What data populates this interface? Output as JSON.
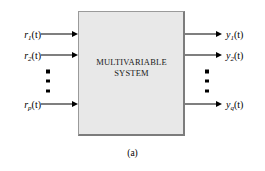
{
  "figure": {
    "caption": "(a)",
    "block": {
      "line1": "MULTIVARIABLE",
      "line2": "SYSTEM",
      "fill_color": "#e8e8e8",
      "border_color": "#7c7c7c"
    },
    "inputs": [
      {
        "base": "r",
        "sub": "1",
        "arg": "(t)",
        "full": "r1(t)",
        "y": 34
      },
      {
        "base": "r",
        "sub": "2",
        "arg": "(t)",
        "full": "r2(t)",
        "y": 55
      },
      {
        "base": "r",
        "sub": "p",
        "arg": "(t)",
        "full": "rp(t)",
        "y": 104
      }
    ],
    "outputs": [
      {
        "base": "y",
        "sub": "1",
        "arg": "(t)",
        "full": "y1(t)",
        "y": 34
      },
      {
        "base": "y",
        "sub": "2",
        "arg": "(t)",
        "full": "y2(t)",
        "y": 55
      },
      {
        "base": "y",
        "sub": "q",
        "arg": "(t)",
        "full": "yq(t)",
        "y": 104
      }
    ],
    "ellipsis": {
      "input_dots": 3,
      "output_dots": 3,
      "meaning": "vertical-ellipsis"
    }
  }
}
